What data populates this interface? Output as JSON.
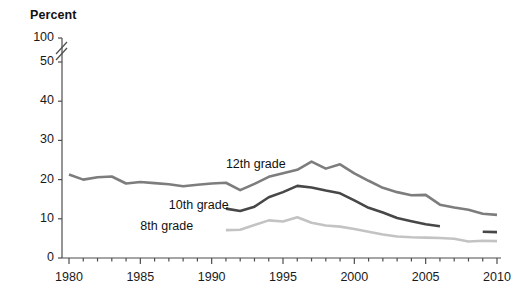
{
  "chart_data": {
    "type": "line",
    "title": "",
    "ylabel": "Percent",
    "xlabel": "",
    "ylim": [
      0,
      50
    ],
    "xlim": [
      1980,
      2010
    ],
    "grid": false,
    "legend_position": "inline-labels",
    "axis_break": {
      "present": true,
      "between": [
        50,
        100
      ],
      "note": "double-slash break on y-axis between 50 and 100"
    },
    "y_ticks": [
      0,
      10,
      20,
      30,
      40,
      50,
      100
    ],
    "y_tick_labels": [
      "0",
      "10",
      "20",
      "30",
      "40",
      "50",
      "100"
    ],
    "x_ticks": [
      1980,
      1985,
      1990,
      1995,
      2000,
      2005,
      2010
    ],
    "x_tick_labels": [
      "1980",
      "1985",
      "1990",
      "1995",
      "2000",
      "2005",
      "2010"
    ],
    "x_minor_tick_interval": 1,
    "series": [
      {
        "name": "12th grade",
        "color": "#7d7d7d",
        "label_x": 1991,
        "label_y": 23.5,
        "x": [
          1980,
          1981,
          1982,
          1983,
          1984,
          1985,
          1986,
          1987,
          1988,
          1989,
          1990,
          1991,
          1992,
          1993,
          1994,
          1995,
          1996,
          1997,
          1998,
          1999,
          2000,
          2001,
          2002,
          2003,
          2004,
          2005,
          2006,
          2007,
          2008,
          2009,
          2010
        ],
        "values": [
          21.3,
          20.0,
          20.6,
          20.8,
          19.0,
          19.4,
          19.1,
          18.8,
          18.3,
          18.7,
          19.0,
          19.2,
          17.3,
          18.9,
          20.7,
          21.6,
          22.5,
          24.6,
          22.8,
          23.9,
          21.6,
          19.7,
          17.9,
          16.8,
          16.0,
          16.1,
          13.6,
          12.9,
          12.3,
          11.3,
          11.0
        ]
      },
      {
        "name": "10th grade",
        "color": "#474747",
        "label_x": 1987,
        "label_y": 13.1,
        "x": [
          1991,
          1992,
          1993,
          1994,
          1995,
          1996,
          1997,
          1998,
          1999,
          2000,
          2001,
          2002,
          2003,
          2004,
          2005,
          2006,
          2009,
          2010
        ],
        "values": [
          12.6,
          12.0,
          13.1,
          15.5,
          16.8,
          18.4,
          18.0,
          17.2,
          16.5,
          14.7,
          12.8,
          11.6,
          10.2,
          9.4,
          8.6,
          8.1,
          6.7,
          6.6
        ],
        "gap_between": [
          2006,
          2009
        ]
      },
      {
        "name": "8th grade",
        "color": "#c3c3c3",
        "label_x": 1985,
        "label_y": 7.6,
        "x": [
          1991,
          1992,
          1993,
          1994,
          1995,
          1996,
          1997,
          1998,
          1999,
          2000,
          2001,
          2002,
          2003,
          2004,
          2005,
          2006,
          2007,
          2008,
          2009,
          2010
        ],
        "values": [
          7.1,
          7.2,
          8.4,
          9.6,
          9.3,
          10.4,
          9.0,
          8.3,
          8.0,
          7.4,
          6.7,
          6.0,
          5.5,
          5.3,
          5.2,
          5.1,
          4.9,
          4.2,
          4.4,
          4.3
        ]
      }
    ]
  },
  "axis": {
    "percent_title": "Percent"
  }
}
